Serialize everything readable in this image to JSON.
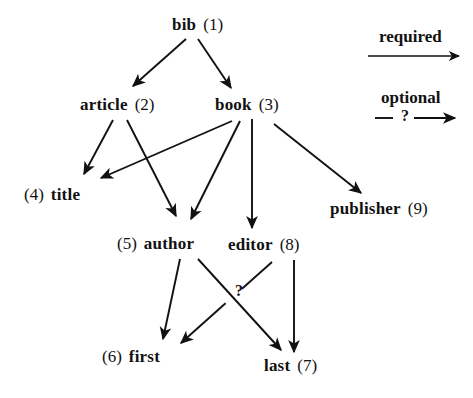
{
  "figure": {
    "type": "directed-graph-diagram",
    "background_color": "#ffffff",
    "ink_color": "#111111"
  },
  "nodes": [
    {
      "key": "bib",
      "id": "(1)",
      "label": "bib",
      "id_side": "right",
      "x": 172,
      "y": 16,
      "text": "bib  (1)"
    },
    {
      "key": "article",
      "id": "(2)",
      "label": "article",
      "id_side": "right",
      "x": 80,
      "y": 96,
      "text": "article  (2)"
    },
    {
      "key": "book",
      "id": "(3)",
      "label": "book",
      "id_side": "right",
      "x": 215,
      "y": 96,
      "text": "book  (3)"
    },
    {
      "key": "title",
      "id": "(4)",
      "label": "title",
      "id_side": "left",
      "x": 24,
      "y": 186,
      "text": "(4) title"
    },
    {
      "key": "author",
      "id": "(5)",
      "label": "author",
      "id_side": "left",
      "x": 117,
      "y": 235,
      "text": "(5)  author"
    },
    {
      "key": "editor",
      "id": "(8)",
      "label": "editor",
      "id_side": "right",
      "x": 228,
      "y": 236,
      "text": "editor (8)"
    },
    {
      "key": "publisher",
      "id": "(9)",
      "label": "publisher",
      "id_side": "right",
      "x": 330,
      "y": 200,
      "text": "publisher  (9)"
    },
    {
      "key": "first",
      "id": "(6)",
      "label": "first",
      "id_side": "left",
      "x": 102,
      "y": 348,
      "text": "(6)  first"
    },
    {
      "key": "last",
      "id": "(7)",
      "label": "last",
      "id_side": "right",
      "x": 264,
      "y": 357,
      "text": "last  (7)"
    }
  ],
  "edges": [
    {
      "from": "bib",
      "to": "article",
      "kind": "required",
      "x1": 186,
      "y1": 39,
      "x2": 133,
      "y2": 86
    },
    {
      "from": "bib",
      "to": "book",
      "kind": "required",
      "x1": 198,
      "y1": 39,
      "x2": 231,
      "y2": 88
    },
    {
      "from": "article",
      "to": "title",
      "kind": "required",
      "x1": 113,
      "y1": 120,
      "x2": 84,
      "y2": 174
    },
    {
      "from": "article",
      "to": "author",
      "kind": "required",
      "x1": 127,
      "y1": 120,
      "x2": 176,
      "y2": 216
    },
    {
      "from": "book",
      "to": "title",
      "kind": "required",
      "x1": 232,
      "y1": 121,
      "x2": 101,
      "y2": 178
    },
    {
      "from": "book",
      "to": "author",
      "kind": "required",
      "x1": 240,
      "y1": 121,
      "x2": 191,
      "y2": 219
    },
    {
      "from": "book",
      "to": "editor",
      "kind": "required",
      "x1": 252,
      "y1": 119,
      "x2": 252,
      "y2": 228
    },
    {
      "from": "book",
      "to": "publisher",
      "kind": "required",
      "x1": 274,
      "y1": 124,
      "x2": 361,
      "y2": 193
    },
    {
      "from": "author",
      "to": "first",
      "kind": "required",
      "x1": 180,
      "y1": 259,
      "x2": 163,
      "y2": 339
    },
    {
      "from": "author",
      "to": "last",
      "kind": "required",
      "x1": 198,
      "y1": 259,
      "x2": 281,
      "y2": 350
    },
    {
      "from": "editor",
      "to": "first",
      "kind": "optional",
      "x1": 272,
      "y1": 262,
      "x2": 181,
      "y2": 343
    },
    {
      "from": "editor",
      "to": "last",
      "kind": "required",
      "x1": 294,
      "y1": 260,
      "x2": 294,
      "y2": 352
    }
  ],
  "annotations": [
    {
      "key": "optional-question-mark",
      "text": "?",
      "x": 235,
      "y": 283
    }
  ],
  "legend": {
    "items": [
      {
        "key": "required",
        "label": "required",
        "kind": "solid-arrow",
        "label_x": 379,
        "label_y": 28,
        "x1": 368,
        "y1": 56,
        "x2": 459,
        "y2": 56
      },
      {
        "key": "optional",
        "label": "optional",
        "kind": "dashed-arrow-with-question-mark",
        "marker": "?",
        "label_x": 381,
        "label_y": 89,
        "x1": 375,
        "y1": 118,
        "x2": 455,
        "y2": 118,
        "marker_x": 401,
        "marker_y": 108
      }
    ]
  }
}
